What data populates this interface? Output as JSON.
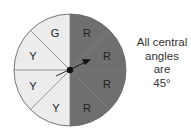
{
  "spinner": {
    "sectors": [
      {
        "label": "R",
        "color": "#6d6d6d"
      },
      {
        "label": "R",
        "color": "#6d6d6d"
      },
      {
        "label": "R",
        "color": "#6d6d6d"
      },
      {
        "label": "R",
        "color": "#6d6d6d"
      },
      {
        "label": "Y",
        "color": "#ededed"
      },
      {
        "label": "Y",
        "color": "#ededed"
      },
      {
        "label": "Y",
        "color": "#ededed"
      },
      {
        "label": "G",
        "color": "#ededed"
      }
    ]
  },
  "note": {
    "line1": "All central",
    "line2": "angles",
    "line3": "are",
    "line4": "45°"
  }
}
